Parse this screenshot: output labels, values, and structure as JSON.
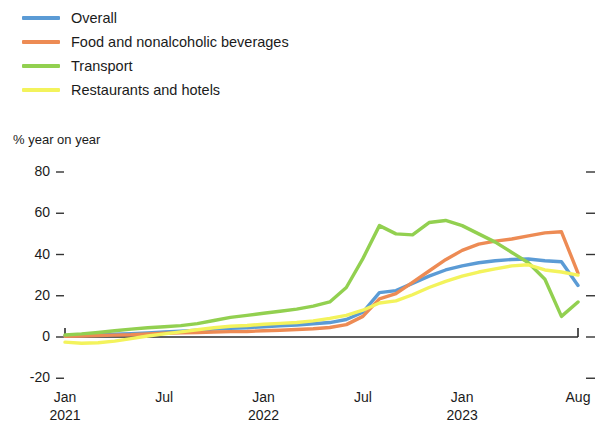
{
  "legend": {
    "position": "top-left",
    "items": [
      {
        "label": "Overall",
        "color": "#5B9BD5",
        "key": "overall"
      },
      {
        "label": "Food and nonalcoholic beverages",
        "color": "#ED8B54",
        "key": "food"
      },
      {
        "label": "Transport",
        "color": "#92D050",
        "key": "transport"
      },
      {
        "label": "Restaurants and hotels",
        "color": "#F3F35C",
        "key": "restaurants"
      }
    ]
  },
  "axes": {
    "y_caption": "% year on year",
    "y_ticks": [
      "80",
      "60",
      "40",
      "20",
      "0",
      "-20"
    ],
    "x_ticks": [
      {
        "month": "Jan",
        "year": "2021"
      },
      {
        "month": "Jul",
        "year": ""
      },
      {
        "month": "Jan",
        "year": "2022"
      },
      {
        "month": "Jul",
        "year": ""
      },
      {
        "month": "Jan",
        "year": "2023"
      },
      {
        "month": "Aug",
        "year": ""
      }
    ]
  },
  "chart_data": {
    "type": "line",
    "title": "",
    "subtitle": "",
    "xlabel": "",
    "ylabel": "% year on year",
    "ylim": [
      -20,
      80
    ],
    "yticks": [
      -20,
      0,
      20,
      40,
      60,
      80
    ],
    "grid": false,
    "legend_position": "top-left",
    "x": [
      "Jan 2021",
      "Feb 2021",
      "Mar 2021",
      "Apr 2021",
      "May 2021",
      "Jun 2021",
      "Jul 2021",
      "Aug 2021",
      "Sep 2021",
      "Oct 2021",
      "Nov 2021",
      "Dec 2021",
      "Jan 2022",
      "Feb 2022",
      "Mar 2022",
      "Apr 2022",
      "May 2022",
      "Jun 2022",
      "Jul 2022",
      "Aug 2022",
      "Sep 2022",
      "Oct 2022",
      "Nov 2022",
      "Dec 2022",
      "Jan 2023",
      "Feb 2023",
      "Mar 2023",
      "Apr 2023",
      "May 2023",
      "Jun 2023",
      "Jul 2023",
      "Aug 2023"
    ],
    "xtick_positions": [
      0,
      6,
      12,
      18,
      24,
      31
    ],
    "series": [
      {
        "name": "Overall",
        "color": "#5B9BD5",
        "values": [
          0.5,
          0.7,
          1.0,
          1.3,
          1.6,
          2.0,
          2.4,
          2.8,
          3.3,
          3.8,
          4.2,
          4.5,
          5.0,
          5.4,
          5.8,
          6.4,
          7.0,
          8.5,
          12.0,
          21.5,
          22.5,
          26.0,
          29.5,
          32.5,
          34.5,
          36.0,
          37.0,
          37.6,
          37.8,
          37.0,
          36.5,
          25.0
        ]
      },
      {
        "name": "Food and nonalcoholic beverages",
        "color": "#ED8B54",
        "values": [
          0.4,
          0.5,
          0.7,
          0.9,
          1.1,
          1.5,
          1.8,
          2.0,
          2.2,
          2.4,
          2.6,
          2.7,
          3.0,
          3.3,
          3.6,
          4.0,
          4.6,
          6.0,
          10.0,
          18.5,
          21.0,
          26.5,
          32.0,
          37.5,
          42.0,
          45.0,
          46.5,
          47.5,
          49.0,
          50.5,
          51.0,
          31.0
        ]
      },
      {
        "name": "Transport",
        "color": "#92D050",
        "values": [
          1.0,
          1.5,
          2.2,
          3.0,
          3.8,
          4.5,
          5.0,
          5.5,
          6.5,
          8.0,
          9.5,
          10.5,
          11.5,
          12.5,
          13.5,
          15.0,
          17.0,
          24.0,
          38.0,
          54.0,
          50.0,
          49.5,
          55.5,
          56.5,
          54.0,
          50.0,
          46.0,
          41.0,
          36.0,
          28.0,
          10.0,
          17.0
        ]
      },
      {
        "name": "Restaurants and hotels",
        "color": "#F3F35C",
        "values": [
          -2.5,
          -3.0,
          -2.8,
          -2.0,
          -0.8,
          0.5,
          1.5,
          2.5,
          3.5,
          4.5,
          5.2,
          5.6,
          6.2,
          6.6,
          7.0,
          7.8,
          9.0,
          10.5,
          13.0,
          16.5,
          17.5,
          20.5,
          24.0,
          27.0,
          29.5,
          31.5,
          33.0,
          34.5,
          35.0,
          32.5,
          31.5,
          30.0
        ]
      }
    ]
  }
}
